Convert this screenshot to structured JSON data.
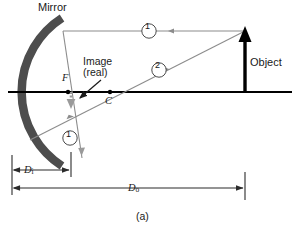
{
  "figure": {
    "caption": "(a)",
    "title_hidden": "",
    "colors": {
      "mirror": "#4d4d4d",
      "axis": "#000000",
      "object": "#000000",
      "ray": "#8c8c8c",
      "image": "#9a9a9a",
      "dimension": "#2b2b2b",
      "text": "#1a1a1a",
      "background": "#ffffff"
    }
  },
  "labels": {
    "mirror": "Mirror",
    "object": "Object",
    "image_line1": "Image",
    "image_line2": "(real)",
    "focal_point": "F",
    "center_of_curvature": "C",
    "ray1_top": "1",
    "ray2": "2",
    "ray1_bottom": "1",
    "distance_image": "D",
    "distance_image_sub": "i",
    "distance_object": "D",
    "distance_object_sub": "o"
  },
  "elements": {
    "mirror": {
      "name": "concave-mirror-arc",
      "description": "thick dark gray concave arc opening to the right"
    },
    "principal_axis": {
      "name": "principal-axis",
      "description": "horizontal black line from mirror vertex to right edge"
    },
    "object_arrow": {
      "name": "object-arrow",
      "description": "thick black upward arrow at right, standing on the axis"
    },
    "image_arrow": {
      "name": "image-arrow",
      "description": "small gray downward arrow just past the focal point, inverted and reduced"
    },
    "ray1": {
      "name": "ray-1",
      "description": "parallel ray from object tip to mirror, reflects through F and continues down-left"
    },
    "ray2": {
      "name": "ray-2",
      "description": "ray from object tip through C to the mirror, reflects back along itself"
    },
    "pointer": {
      "name": "image-callout-pointer",
      "description": "arrow from Image (real) label to the image arrow"
    },
    "dim_di": {
      "name": "dimension-di",
      "description": "double-headed dimension for image distance"
    },
    "dim_do": {
      "name": "dimension-do",
      "description": "double-headed dimension for object distance"
    }
  },
  "geometry": {
    "mirror_vertex": {
      "x": 12,
      "y": 92
    },
    "focal_point": {
      "x": 68,
      "y": 92
    },
    "center_of_curvature": {
      "x": 110,
      "y": 92
    },
    "object_base": {
      "x": 245,
      "y": 92
    },
    "object_tip": {
      "x": 245,
      "y": 31
    },
    "image_base": {
      "x": 71,
      "y": 92
    },
    "image_tip": {
      "x": 71,
      "y": 108
    },
    "axis_right_end": {
      "x": 292,
      "y": 92
    }
  }
}
